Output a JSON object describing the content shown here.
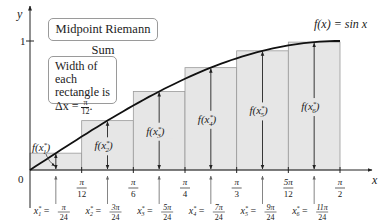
{
  "chart_data": {
    "type": "bar",
    "title": "Midpoint Riemann Sum",
    "function_label": "f(x) = sin x",
    "note": {
      "line1": "Width of each",
      "line2": "rectangle is",
      "line3_prefix": "Δx = ",
      "dx_num": "π",
      "dx_den": "12",
      "line3_suffix": "."
    },
    "xlabel": "x",
    "ylabel": "y",
    "x_range": [
      0,
      1.5708
    ],
    "ylim": [
      0,
      1
    ],
    "grid": false,
    "origin_label": "0",
    "y_ticks": [
      {
        "value": 1,
        "label": "1"
      }
    ],
    "x_ticks": [
      {
        "value": 0.2618,
        "num": "π",
        "den": "12"
      },
      {
        "value": 0.5236,
        "num": "π",
        "den": "6"
      },
      {
        "value": 0.7854,
        "num": "π",
        "den": "4"
      },
      {
        "value": 1.0472,
        "num": "π",
        "den": "3"
      },
      {
        "value": 1.309,
        "num": "5π",
        "den": "12"
      },
      {
        "value": 1.5708,
        "num": "π",
        "den": "2"
      }
    ],
    "categories": [
      "[0, π/12]",
      "[π/12, π/6]",
      "[π/6, π/4]",
      "[π/4, π/3]",
      "[π/3, 5π/12]",
      "[5π/12, π/2]"
    ],
    "midpoints": [
      {
        "name": "x1*",
        "sub": "1",
        "num": "π",
        "den": "24",
        "x": 0.1309
      },
      {
        "name": "x2*",
        "sub": "2",
        "num": "3π",
        "den": "24",
        "x": 0.3927
      },
      {
        "name": "x3*",
        "sub": "3",
        "num": "5π",
        "den": "24",
        "x": 0.6545
      },
      {
        "name": "x4*",
        "sub": "4",
        "num": "7π",
        "den": "24",
        "x": 0.9163
      },
      {
        "name": "x5*",
        "sub": "5",
        "num": "9π",
        "den": "24",
        "x": 1.1781
      },
      {
        "name": "x6*",
        "sub": "6",
        "num": "11π",
        "den": "24",
        "x": 1.4399
      }
    ],
    "values": [
      0.1305,
      0.3827,
      0.6088,
      0.7934,
      0.9239,
      0.9914
    ],
    "height_labels": [
      "f(x1*)",
      "f(x2*)",
      "f(x3*)",
      "f(x4*)",
      "f(x5*)",
      "f(x6*)"
    ],
    "colors": {
      "rect_fill": "#e6e6e6",
      "rect_stroke": "#9a9a9a",
      "curve": "#111111",
      "axis": "#222222",
      "arrow": "#222222"
    }
  }
}
